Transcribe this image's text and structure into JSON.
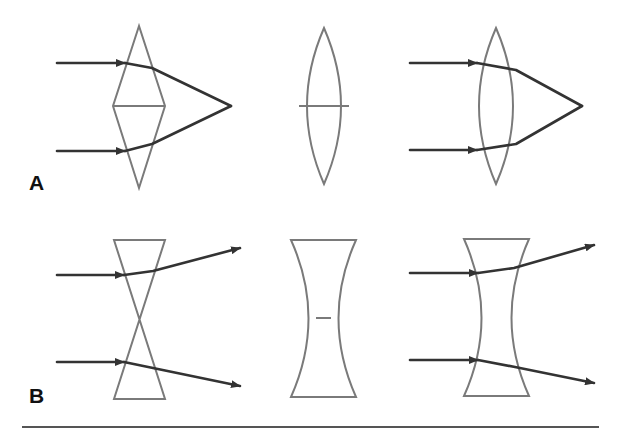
{
  "figure": {
    "panels": [
      {
        "label": "A",
        "description": "Converging: two base-to-base prisms approximating a convex lens; parallel rays converge to a focal point"
      },
      {
        "label": "B",
        "description": "Diverging: two apex-to-apex prisms approximating a concave lens; parallel rays diverge"
      }
    ],
    "row_a": {
      "label": "A",
      "items": [
        {
          "name": "prism-pair-base-to-base",
          "rays": 2,
          "ray_behavior": "converge"
        },
        {
          "name": "biconvex-lens",
          "rays": 0
        },
        {
          "name": "biconvex-lens-with-rays",
          "rays": 2,
          "ray_behavior": "converge"
        }
      ]
    },
    "row_b": {
      "label": "B",
      "items": [
        {
          "name": "prism-pair-apex-to-apex",
          "rays": 2,
          "ray_behavior": "diverge"
        },
        {
          "name": "biconcave-lens",
          "rays": 0
        },
        {
          "name": "biconcave-lens-with-rays",
          "rays": 2,
          "ray_behavior": "diverge"
        }
      ]
    },
    "colors": {
      "lens_outline": "#7a7a7a",
      "ray": "#333333",
      "label": "#111111",
      "rule": "#555555"
    }
  }
}
